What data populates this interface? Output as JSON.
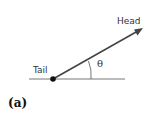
{
  "diagram": {
    "labels": {
      "head": "Head",
      "tail": "Tail",
      "angle": "θ"
    },
    "caption": "(a)",
    "colors": {
      "arrow": "#444444",
      "baseline": "#777777",
      "dot": "#111111",
      "text": "#333333"
    },
    "geometry": {
      "baseline": {
        "x1": 29,
        "x2": 125,
        "y": 79
      },
      "tail_point": {
        "x": 53,
        "y": 79
      },
      "head_point": {
        "x": 143,
        "y": 28
      }
    }
  }
}
